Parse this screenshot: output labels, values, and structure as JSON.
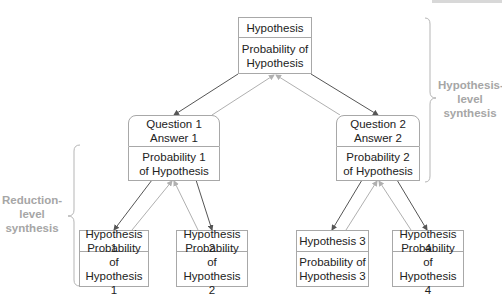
{
  "diagram": {
    "root": {
      "title": "Hypothesis",
      "subtitle": "Probability of\nHypothesis"
    },
    "questions": [
      {
        "title": "Question 1\nAnswer 1",
        "subtitle": "Probability 1\nof Hypothesis"
      },
      {
        "title": "Question 2\nAnswer 2",
        "subtitle": "Probability 2\nof Hypothesis"
      }
    ],
    "leaves": [
      {
        "title": "Hypothesis 1",
        "subtitle": "Probability of\nHypothesis 1"
      },
      {
        "title": "Hypothesis 2",
        "subtitle": "Probability of\nHypothesis 2"
      },
      {
        "title": "Hypothesis 3",
        "subtitle": "Probability of\nHypothesis 3"
      },
      {
        "title": "Hypothesis 4",
        "subtitle": "Probability of\nHypothesis 4"
      }
    ],
    "brace_labels": {
      "hypothesis_level": "Hypothesis-\nlevel\nsynthesis",
      "reduction_level": "Reduction-\nlevel\nsynthesis"
    },
    "colors": {
      "down_arrow": "#555555",
      "up_arrow": "#b0b0b0",
      "label": "#a6a6a6",
      "box_border": "#a8a8a8"
    }
  }
}
